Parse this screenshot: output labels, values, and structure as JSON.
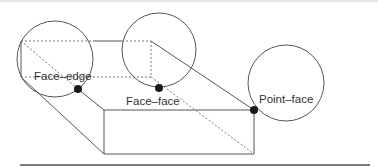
{
  "diagram": {
    "title": "",
    "colors": {
      "line": "#555555",
      "dotted": "#777777",
      "contact_point": "#1a1a1a",
      "circle": "#555555",
      "text": "#333333"
    },
    "labels": {
      "face_edge": "Face–edge",
      "face_face": "Face–face",
      "point_face": "Point–face"
    },
    "contacts": [
      {
        "type": "face_edge",
        "label": "Face–edge",
        "circle_center": [
          55,
          59
        ],
        "radius": 38,
        "point": [
          78,
          89
        ]
      },
      {
        "type": "face_face",
        "label": "Face–face",
        "circle_center": [
          159,
          50
        ],
        "radius": 37,
        "point": [
          159,
          88
        ]
      },
      {
        "type": "point_face",
        "label": "Point–face",
        "circle_center": [
          286,
          83
        ],
        "radius": 38,
        "point": [
          254,
          110
        ]
      }
    ]
  }
}
